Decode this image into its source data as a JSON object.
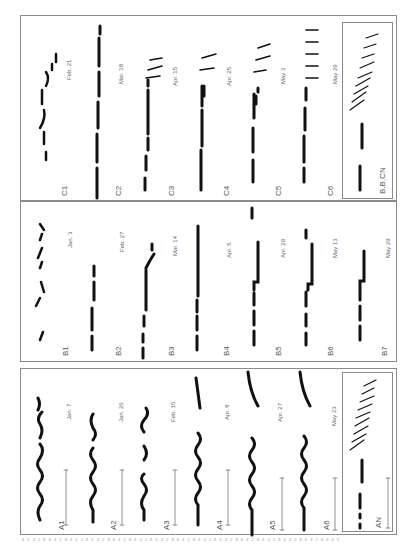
{
  "figure": {
    "orientation": "rotated 90 degrees counter-clockwise",
    "panels": {
      "A": {
        "rows": [
          {
            "id": "A1",
            "date": "Jan. 7"
          },
          {
            "id": "A2",
            "date": "Jan. 26"
          },
          {
            "id": "A3",
            "date": "Feb. 15"
          },
          {
            "id": "A4",
            "date": "Apr. 8"
          },
          {
            "id": "A5",
            "date": "Apr. 27"
          },
          {
            "id": "A6",
            "date": "May 23"
          }
        ],
        "inset": {
          "id": "AN"
        }
      },
      "B": {
        "rows": [
          {
            "id": "B1",
            "date": "Jan. 3"
          },
          {
            "id": "B2",
            "date": "Feb. 27"
          },
          {
            "id": "B3",
            "date": "Mar. 14"
          },
          {
            "id": "B4",
            "date": "Apr. 5"
          },
          {
            "id": "B5",
            "date": "Apr. 29"
          },
          {
            "id": "B6",
            "date": "May 13"
          },
          {
            "id": "B7",
            "date": "May 29"
          }
        ]
      },
      "C": {
        "rows": [
          {
            "id": "C1",
            "date": "Feb. 21"
          },
          {
            "id": "C2",
            "date": "Mar. 18"
          },
          {
            "id": "C3",
            "date": "Apr. 15"
          },
          {
            "id": "C4",
            "date": "Apr. 25"
          },
          {
            "id": "C5",
            "date": "May 3"
          },
          {
            "id": "C6",
            "date": "May 29"
          }
        ],
        "inset": {
          "id": "B.B.CN"
        }
      }
    },
    "axis_ticks": "8 6 4 2 8 6 4 2 8 6 4 2 8 6 4 2 8 6 4 2 8 6 4 2 8 6 4 2 8 6 4 2 8 6 4 2 8 6 4 2 8 6 4 2 8 6 4 2 8 6 4 2 8 6 4 2 8 6 4 2"
  }
}
